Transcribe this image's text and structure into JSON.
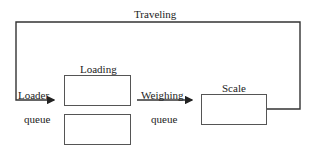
{
  "diagram": {
    "loop_label": "Traveling",
    "loading": {
      "title": "Loading",
      "slots": 2
    },
    "loader_queue": {
      "line1": "Loader",
      "line2": "queue"
    },
    "weighing_queue": {
      "line1": "Weighing",
      "line2": "queue"
    },
    "scale": {
      "title": "Scale"
    }
  }
}
